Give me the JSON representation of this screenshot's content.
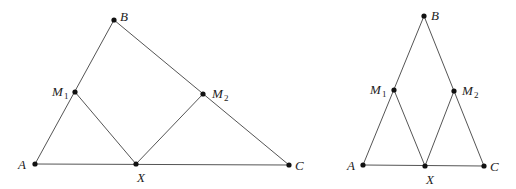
{
  "figures": [
    {
      "name": "scalene-triangle",
      "points": {
        "A": {
          "x": 35,
          "y": 164
        },
        "B": {
          "x": 114,
          "y": 20
        },
        "C": {
          "x": 289,
          "y": 165
        },
        "M1": {
          "x": 75,
          "y": 92
        },
        "M2": {
          "x": 203,
          "y": 94
        },
        "X": {
          "x": 136,
          "y": 164
        }
      },
      "labels": {
        "A": "A",
        "B": "B",
        "C": "C",
        "M1": "M",
        "M1_sub": "1",
        "M2": "M",
        "M2_sub": "2",
        "X": "X"
      }
    },
    {
      "name": "isosceles-triangle",
      "points": {
        "A": {
          "x": 363,
          "y": 165
        },
        "B": {
          "x": 424,
          "y": 16
        },
        "C": {
          "x": 484,
          "y": 166
        },
        "M1": {
          "x": 394,
          "y": 90
        },
        "M2": {
          "x": 454,
          "y": 91
        },
        "X": {
          "x": 425,
          "y": 166
        }
      },
      "labels": {
        "A": "A",
        "B": "B",
        "C": "C",
        "M1": "M",
        "M1_sub": "1",
        "M2": "M",
        "M2_sub": "2",
        "X": "X"
      }
    }
  ],
  "colors": {
    "stroke": "#555555",
    "point": "#111111",
    "text": "#222222"
  }
}
